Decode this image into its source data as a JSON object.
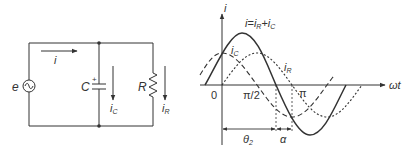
{
  "circuit": {
    "source_label": "e",
    "current_label": "i",
    "capacitor_label": "C",
    "capacitor_polarity": "+",
    "capacitor_current_label": "i",
    "capacitor_current_sub": "C",
    "resistor_label": "R",
    "resistor_current_label": "i",
    "resistor_current_sub": "R"
  },
  "waveform": {
    "y_axis_label": "i",
    "x_axis_label": "ωt",
    "equation": {
      "lhs": "i",
      "eq": "=",
      "t1": "i",
      "t1_sub": "R",
      "plus": "+",
      "t2": "i",
      "t2_sub": "C"
    },
    "curve_labels": {
      "ic": "i",
      "ic_sub": "C",
      "ir": "i",
      "ir_sub": "R"
    },
    "ticks": {
      "origin": "0",
      "half_pi": "π/2",
      "pi": "π"
    },
    "angles": {
      "theta": "θ",
      "theta_sub": "2",
      "alpha": "α"
    }
  },
  "colors": {
    "stroke": "#333333",
    "background": "#ffffff"
  }
}
